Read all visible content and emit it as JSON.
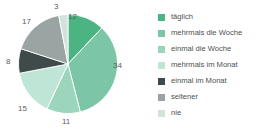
{
  "chart_data": {
    "type": "pie",
    "title": "",
    "subtitle": "",
    "xlabel": "",
    "ylabel": "",
    "grid": false,
    "legend_position": "right",
    "total": 100,
    "categories": [
      "täglich",
      "mehrmals die Woche",
      "einmal die Woche",
      "mehrmals im Monat",
      "einmal im Monat",
      "seltener",
      "nie"
    ],
    "values": [
      12,
      34,
      11,
      15,
      8,
      17,
      3
    ],
    "colors": [
      "#4CB483",
      "#7CC5A6",
      "#9BD5BC",
      "#BEE5D5",
      "#3F4A4A",
      "#9AA5A3",
      "#D4E2DC"
    ],
    "slices": [
      {
        "label": "täglich",
        "value": 12,
        "value_text": "12",
        "color": "#4CB483"
      },
      {
        "label": "mehrmals die Woche",
        "value": 34,
        "value_text": "34",
        "color": "#7CC5A6"
      },
      {
        "label": "einmal die Woche",
        "value": 11,
        "value_text": "11",
        "color": "#9BD5BC"
      },
      {
        "label": "mehrmals im Monat",
        "value": 15,
        "value_text": "15",
        "color": "#BEE5D5"
      },
      {
        "label": "einmal im Monat",
        "value": 8,
        "value_text": "8",
        "color": "#3F4A4A"
      },
      {
        "label": "seltener",
        "value": 17,
        "value_text": "17",
        "color": "#9AA5A3"
      },
      {
        "label": "nie",
        "value": 3,
        "value_text": "3",
        "color": "#D4E2DC"
      }
    ]
  },
  "legend": {
    "items": [
      {
        "label": "täglich",
        "color": "#4CB483"
      },
      {
        "label": "mehrmals die Woche",
        "color": "#7CC5A6"
      },
      {
        "label": "einmal die Woche",
        "color": "#9BD5BC"
      },
      {
        "label": "mehrmals im Monat",
        "color": "#BEE5D5"
      },
      {
        "label": "einmal im Monat",
        "color": "#3F4A4A"
      },
      {
        "label": "seltener",
        "color": "#9AA5A3"
      },
      {
        "label": "nie",
        "color": "#D4E2DC"
      }
    ]
  },
  "labels": {
    "v12": "12",
    "v34": "34",
    "v11": "11",
    "v15": "15",
    "v8": "8",
    "v17": "17",
    "v3": "3"
  }
}
